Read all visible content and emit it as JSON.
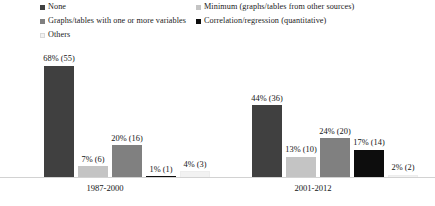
{
  "chart_data": {
    "type": "bar",
    "title": "",
    "subtitle": "",
    "xlabel": "",
    "ylabel": "",
    "ylim": [
      0,
      80
    ],
    "grid": false,
    "legend_position": "top",
    "orientation": "vertical",
    "grouping": "clustered",
    "value_label_format": "percent (count)",
    "categories": [
      "1987-2000",
      "2001-2012"
    ],
    "series": [
      {
        "name": "None",
        "color": "#404040",
        "values": [
          68,
          44
        ],
        "counts": [
          55,
          36
        ],
        "labels": [
          "68% (55)",
          "44% (36)"
        ]
      },
      {
        "name": "Minimum (graphs/tables from other sources)",
        "color": "#c4c4c4",
        "values": [
          7,
          13
        ],
        "counts": [
          6,
          10
        ],
        "labels": [
          "7% (6)",
          "13% (10)"
        ]
      },
      {
        "name": "Graphs/tables with one or more variables",
        "color": "#808080",
        "values": [
          20,
          24
        ],
        "counts": [
          16,
          20
        ],
        "labels": [
          "20% (16)",
          "24% (20)"
        ]
      },
      {
        "name": "Correlation/regression (quantitative)",
        "color": "#0d0d0d",
        "values": [
          1,
          17
        ],
        "counts": [
          1,
          14
        ],
        "labels": [
          "1% (1)",
          "17% (14)"
        ]
      },
      {
        "name": "Others",
        "color": "#f2f2f2",
        "values": [
          4,
          2
        ],
        "counts": [
          3,
          2
        ],
        "labels": [
          "4% (3)",
          "2% (2)"
        ]
      }
    ]
  },
  "legend": {
    "items": [
      {
        "label": "None",
        "color": "#404040"
      },
      {
        "label": "Minimum (graphs/tables from other sources)",
        "color": "#c4c4c4"
      },
      {
        "label": "Graphs/tables with one or more variables",
        "color": "#808080"
      },
      {
        "label": "Correlation/regression (quantitative)",
        "color": "#0d0d0d"
      },
      {
        "label": "Others",
        "color": "#f2f2f2"
      }
    ]
  },
  "axis": {
    "baseline_color": "#d2d2d2",
    "category_labels": [
      "1987-2000",
      "2001-2012"
    ]
  }
}
